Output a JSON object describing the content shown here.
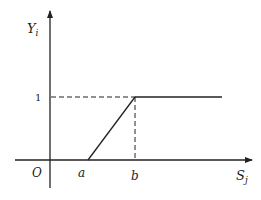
{
  "diagram": {
    "y_axis_label": "Y",
    "y_axis_subscript": "i",
    "x_axis_label": "S",
    "x_axis_subscript": "j",
    "origin_label": "O",
    "y_tick_label": "1",
    "x_tick_labels": [
      "a",
      "b"
    ],
    "colors": {
      "stroke": "#222222",
      "background": "#ffffff"
    },
    "function": {
      "description": "Piecewise linear: 0 for S_j <= a, rises linearly from a to b, equals 1 for S_j >= b",
      "points": [
        {
          "x": "a",
          "y": 0
        },
        {
          "x": "b",
          "y": 1
        }
      ],
      "plateau_value": 1
    }
  }
}
